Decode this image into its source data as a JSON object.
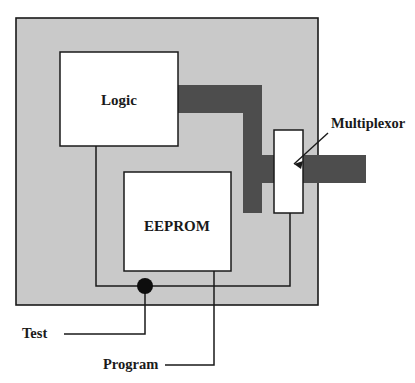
{
  "diagram": {
    "blocks": [
      {
        "id": "logic",
        "label": "Logic",
        "x": 60,
        "y": 52,
        "w": 118,
        "h": 94
      },
      {
        "id": "eeprom",
        "label": "EEPROM",
        "x": 124,
        "y": 172,
        "w": 107,
        "h": 99
      },
      {
        "id": "multiplexor",
        "label": "",
        "x": 274,
        "y": 130,
        "w": 29,
        "h": 83
      }
    ],
    "callouts": [
      {
        "id": "multiplexor-callout",
        "label": "Multiplexor",
        "x": 331,
        "y": 128
      },
      {
        "id": "test-callout",
        "label": "Test",
        "x": 22,
        "y": 332
      },
      {
        "id": "program-callout",
        "label": "Program",
        "x": 103,
        "y": 363
      }
    ],
    "regions": [
      {
        "id": "chip-substrate",
        "label": "chip substrate",
        "x": 16,
        "y": 18,
        "w": 302,
        "h": 287,
        "fill": "#c9c9c9"
      },
      {
        "id": "data-bus",
        "label": "data bus",
        "fill": "#4d4d4d"
      }
    ],
    "colors": {
      "substrate_gray": "#c9c9c9",
      "bus_dark_gray": "#4d4d4d",
      "block_fill": "#ffffff",
      "stroke": "#1a1a1a",
      "text": "#1a1a1a"
    },
    "junction": {
      "id": "test-junction",
      "cx": 145,
      "cy": 286,
      "r": 8
    }
  }
}
